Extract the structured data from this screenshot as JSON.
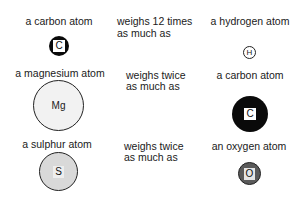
{
  "rows": [
    {
      "left_label": "a carbon atom",
      "left_symbol": "C",
      "relation_line1": "weighs 12 times",
      "relation_line2": "as much as",
      "right_label": "a hydrogen atom",
      "right_symbol": "H"
    },
    {
      "left_label": "a magnesium atom",
      "left_symbol": "Mg",
      "relation_line1": "weighs twice",
      "relation_line2": "as much as",
      "right_label": "a carbon atom",
      "right_symbol": "C"
    },
    {
      "left_label": "a sulphur atom",
      "left_symbol": "S",
      "relation_line1": "weighs twice",
      "relation_line2": "as much as",
      "right_label": "an oxygen atom",
      "right_symbol": "O"
    }
  ],
  "colors": {
    "carbon": "#0a0a0a",
    "hydrogen": "#ffffff",
    "magnesium": "#f2f2f2",
    "sulphur": "#d9d9d9",
    "oxygen": "#5a5a5a",
    "outline": "#222222"
  }
}
